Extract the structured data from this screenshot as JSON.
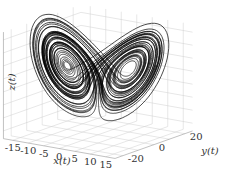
{
  "chart_data": {
    "type": "line3d",
    "title": "",
    "xlabel": "x(t)",
    "ylabel": "y(t)",
    "zlabel": "z(t)",
    "x_ticks": [
      "-15",
      "-10",
      "-5",
      "0",
      "5",
      "10",
      "15"
    ],
    "y_ticks": [
      "-20",
      "0",
      "20"
    ],
    "z_ticks": [
      "15",
      "10",
      "5",
      "0",
      "-5",
      "-10",
      "-15",
      "-20"
    ],
    "xlim": [
      -18,
      18
    ],
    "ylim": [
      -25,
      25
    ],
    "zlim": [
      -23,
      18
    ],
    "grid": true,
    "line_color": "#000000",
    "params": {
      "sigma": 10,
      "rho": 28,
      "beta": 2.667
    }
  }
}
